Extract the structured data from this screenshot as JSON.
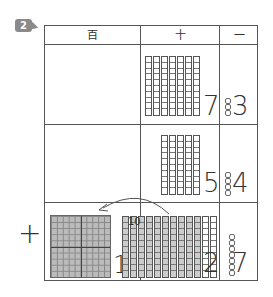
{
  "problem_number": "2",
  "headers": {
    "hundreds": "百",
    "tens": "十",
    "ones": "一"
  },
  "operator": "+",
  "rows": [
    {
      "label": "addend-1",
      "hundreds": "",
      "tens": {
        "rods": 7,
        "digit": "7"
      },
      "ones": {
        "units": 3,
        "digit": "3"
      }
    },
    {
      "label": "addend-2",
      "hundreds": "",
      "tens": {
        "rods": 5,
        "digit": "5"
      },
      "ones": {
        "units": 4,
        "digit": "4"
      }
    },
    {
      "label": "sum",
      "hundreds": {
        "flats": 1,
        "digit": "1"
      },
      "tens": {
        "rods": 12,
        "shaded_rods": 10,
        "digit": "2",
        "bundle_label": "10"
      },
      "ones": {
        "units": 7,
        "digit": "7"
      }
    }
  ],
  "annotation": "carry arrow from tens to hundreds"
}
